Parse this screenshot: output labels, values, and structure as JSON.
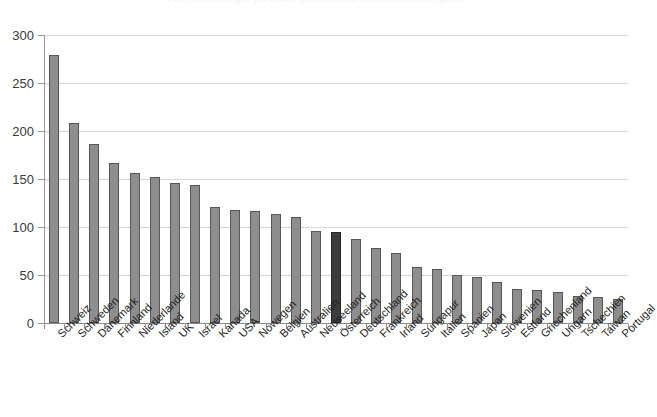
{
  "cut_title": "Patentanmeldungen pro Million Einwohner im internationalen Vergleich",
  "chart_data": {
    "type": "bar",
    "title": "",
    "xlabel": "",
    "ylabel": "",
    "ylim": [
      0,
      300
    ],
    "yticks": [
      0,
      50,
      100,
      150,
      200,
      250,
      300
    ],
    "grid": true,
    "legend": "none",
    "highlight_category": "Österreich",
    "colors": {
      "bar": "#8e8e8e",
      "bar_border": "#575757",
      "highlight": "#3c3c3c",
      "highlight_border": "#262626",
      "grid": "#d6d6d6",
      "axis": "#8c8c8c",
      "text": "#1f1f1f"
    },
    "categories": [
      "Schweiz",
      "Schweden",
      "Dänemark",
      "Finnland",
      "Niederlande",
      "Island",
      "UK",
      "Israel",
      "Kanada",
      "USA",
      "Nowegen",
      "Belgien",
      "Australien",
      "Neuseeland",
      "Österreich",
      "Deutschland",
      "Frankreich",
      "Irland",
      "Sungapur",
      "Italien",
      "Spanien",
      "Japan",
      "Slowenien",
      "Estland",
      "Griechenland",
      "Ungarn",
      "Tschechien",
      "Taiwan",
      "Portugal"
    ],
    "values": [
      279,
      208,
      186,
      167,
      156,
      152,
      146,
      144,
      121,
      118,
      117,
      114,
      110,
      96,
      95,
      88,
      78,
      73,
      58,
      56,
      50,
      48,
      43,
      35,
      34,
      32,
      28,
      27,
      25
    ]
  }
}
